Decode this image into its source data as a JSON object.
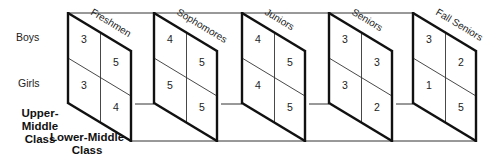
{
  "rows": [
    "Boys",
    "Girls"
  ],
  "depth_labels": {
    "front": [
      "Upper-Middle",
      "Class"
    ],
    "back": [
      "Lower-Middle",
      "Class"
    ]
  },
  "panels": [
    {
      "title": "Freshmen",
      "cells": {
        "boys_upper": "3",
        "boys_lower": "5",
        "girls_upper": "3",
        "girls_lower": "4"
      }
    },
    {
      "title": "Sophomores",
      "cells": {
        "boys_upper": "4",
        "boys_lower": "5",
        "girls_upper": "5",
        "girls_lower": "5"
      }
    },
    {
      "title": "Juniors",
      "cells": {
        "boys_upper": "4",
        "boys_lower": "5",
        "girls_upper": "4",
        "girls_lower": "5"
      }
    },
    {
      "title": "Seniors",
      "cells": {
        "boys_upper": "3",
        "boys_lower": "3",
        "girls_upper": "3",
        "girls_lower": "2"
      }
    },
    {
      "title": "Fall Seniors",
      "cells": {
        "boys_upper": "3",
        "boys_lower": "2",
        "girls_upper": "1",
        "girls_lower": "5"
      }
    }
  ]
}
